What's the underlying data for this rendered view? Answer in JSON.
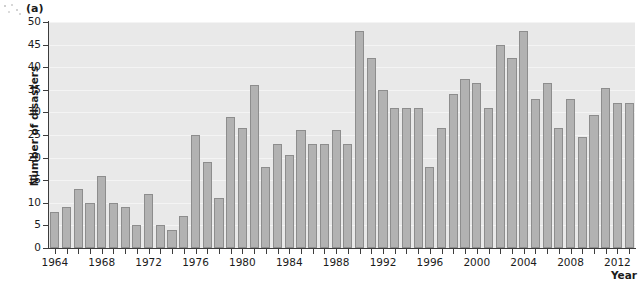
{
  "figure": {
    "panel_label": "(a)",
    "background_color": "#ffffff",
    "plot_background_color": "#e9e9e9",
    "bar_fill_color": "#b2b2b2",
    "bar_stroke_color": "#8d8d8d",
    "gridline_color": "#f4f4f4",
    "axis_color": "#3c3c3c",
    "text_color": "#1b1b1b"
  },
  "axes": {
    "y_title": "Number of disasters",
    "x_title": "Year",
    "y_ticks": [
      "0",
      "5",
      "10",
      "15",
      "20",
      "25",
      "30",
      "35",
      "40",
      "45",
      "50"
    ],
    "x_tick_labels": [
      "1964",
      "1968",
      "1972",
      "1976",
      "1980",
      "1984",
      "1988",
      "1992",
      "1996",
      "2000",
      "2004",
      "2008",
      "2012"
    ]
  },
  "chart_data": {
    "type": "bar",
    "title": "",
    "xlabel": "Year",
    "ylabel": "Number of disasters",
    "ylim": [
      0,
      50
    ],
    "xlim": [
      1963.3,
      1977.7
    ],
    "grid": true,
    "legend": "none",
    "categories": [
      "1964",
      "1965",
      "1966",
      "1967",
      "1968",
      "1969",
      "1970",
      "1971",
      "1972",
      "1973",
      "1974",
      "1975",
      "1976",
      "1977",
      "1978",
      "1979",
      "1980",
      "1981",
      "1982",
      "1983",
      "1984",
      "1985",
      "1986",
      "1987",
      "1988",
      "1989",
      "1990",
      "1991",
      "1992",
      "1993",
      "1994",
      "1995",
      "1996",
      "1997",
      "1998",
      "1999",
      "2000",
      "2001",
      "2002",
      "2003",
      "2004",
      "2005",
      "2006",
      "2007",
      "2008",
      "2009",
      "2010",
      "2011",
      "2012",
      "2013"
    ],
    "values": [
      8,
      9,
      13,
      10,
      16,
      10,
      9,
      5,
      12,
      5,
      4,
      7,
      25,
      19,
      11,
      29,
      26.5,
      36,
      18,
      23,
      20.5,
      26,
      23,
      23,
      26,
      23,
      48,
      42,
      35,
      31,
      31,
      31,
      18,
      26.5,
      34,
      37.5,
      36.5,
      31,
      45,
      42,
      48,
      33,
      36.5,
      26.5,
      33,
      24.5,
      29.5,
      35.5,
      32,
      32
    ],
    "y_tick_values": [
      0,
      5,
      10,
      15,
      20,
      25,
      30,
      35,
      40,
      45,
      50
    ],
    "x_major_tick_years": [
      1964,
      1968,
      1972,
      1976,
      1980,
      1984,
      1988,
      1992,
      1996,
      2000,
      2004,
      2008,
      2012
    ]
  }
}
